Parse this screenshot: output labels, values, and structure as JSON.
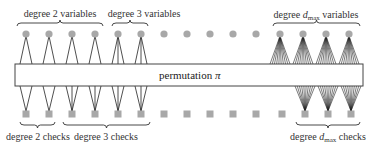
{
  "figure": {
    "box": {
      "label_text": "permutation",
      "label_symbol": "π",
      "x": 15,
      "y": 64,
      "width": 348,
      "height": 22
    },
    "variable_nodes": {
      "y": 34,
      "radius": 3.6,
      "color": "#a8a8a8",
      "x": [
        26,
        49,
        72,
        95,
        118,
        141,
        164,
        187,
        210,
        233,
        256,
        280,
        303,
        326,
        349
      ],
      "degrees": [
        2,
        2,
        2,
        2,
        3,
        3,
        0,
        0,
        0,
        0,
        0,
        10,
        10,
        10,
        10
      ]
    },
    "check_nodes": {
      "y": 114,
      "size": 7,
      "color": "#a8a8a8",
      "x": [
        26,
        49,
        72,
        95,
        118,
        141,
        164,
        187,
        210,
        233,
        256,
        282,
        305,
        328,
        351
      ],
      "degrees": [
        2,
        2,
        3,
        3,
        3,
        3,
        0,
        0,
        0,
        0,
        0,
        0,
        10,
        10,
        10
      ]
    },
    "top_groups": [
      {
        "label_pre": "degree 2 variables",
        "label_sym": "",
        "label_sub": "",
        "label_post": "",
        "x1": 17,
        "x2": 103,
        "cx": 60
      },
      {
        "label_pre": "degree 3 variables",
        "label_sym": "",
        "label_sub": "",
        "label_post": "",
        "x1": 112,
        "x2": 148,
        "cx": 130
      },
      {
        "label_pre": "degree ",
        "label_sym": "d",
        "label_sub": "max",
        "label_post": " variables",
        "x1": 273,
        "x2": 360,
        "cx": 316
      }
    ],
    "bottom_groups": [
      {
        "label_pre": "degree 2 checks",
        "label_sym": "",
        "label_sub": "",
        "label_post": "",
        "x1": 20,
        "x2": 55,
        "cx": 38
      },
      {
        "label_pre": "degree 3 checks",
        "label_sym": "",
        "label_sub": "",
        "label_post": "",
        "x1": 63,
        "x2": 150,
        "cx": 106
      },
      {
        "label_pre": "degree ",
        "label_sym": "d",
        "label_sub": "max",
        "label_post": " checks",
        "x1": 296,
        "x2": 360,
        "cx": 328
      }
    ],
    "edge_color": "#222222",
    "box_stroke": "#444444"
  }
}
